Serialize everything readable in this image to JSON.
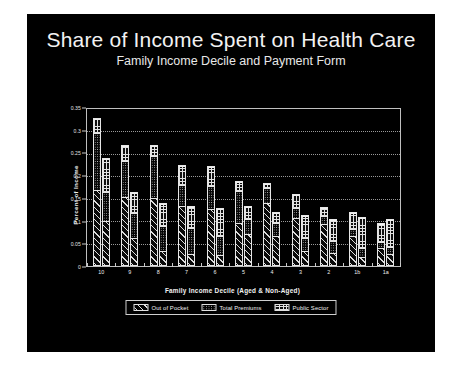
{
  "slide": {
    "title": "Share of Income Spent on Health Care",
    "subtitle": "Family Income Decile and Payment Form",
    "background_color": "#000000",
    "text_color": "#f2f2f2"
  },
  "legend": {
    "items": [
      {
        "label": "Out of Pocket",
        "pattern": "diagonal-hatch"
      },
      {
        "label": "Total Premiums",
        "pattern": "dotted"
      },
      {
        "label": "Public Sector",
        "pattern": "brick"
      }
    ]
  },
  "chart_data": {
    "type": "bar",
    "title": "Share of Income Spent on Health Care",
    "subtitle": "Family Income Decile and Payment Form",
    "xlabel": "Family Income Decile (Aged & Non-Aged)",
    "ylabel": "Percent of Income",
    "ylim": [
      0,
      0.35
    ],
    "yticks": [
      0,
      0.05,
      0.1,
      0.15,
      0.2,
      0.25,
      0.3,
      0.35
    ],
    "ytick_labels": [
      "0",
      "0.05",
      "0.1",
      "0.15",
      "0.2",
      "0.25",
      "0.3",
      "0.35"
    ],
    "grid": true,
    "stacked": true,
    "legend_position": "bottom",
    "categories": [
      "10",
      "9",
      "8",
      "7",
      "6",
      "5",
      "4",
      "3",
      "2",
      "1b",
      "1a"
    ],
    "bars_per_category": 2,
    "bar_subgroups": [
      "Aged",
      "Non-Aged"
    ],
    "series": [
      {
        "name": "Out of Pocket",
        "pattern": "diagonal-hatch",
        "values_aged": [
          0.17,
          0.155,
          0.152,
          0.135,
          0.128,
          0.095,
          0.141,
          0.108,
          0.095,
          0.068,
          0.04
        ],
        "values_nonaged": [
          0.1,
          0.063,
          0.032,
          0.025,
          0.022,
          0.072,
          0.068,
          0.032,
          0.028,
          0.018,
          0.025
        ]
      },
      {
        "name": "Total Premiums",
        "pattern": "dotted",
        "values_aged": [
          0.128,
          0.08,
          0.095,
          0.048,
          0.052,
          0.075,
          0.035,
          0.023,
          0.017,
          0.015,
          0.013
        ],
        "values_nonaged": [
          0.065,
          0.056,
          0.057,
          0.06,
          0.046,
          0.034,
          0.03,
          0.03,
          0.028,
          0.022,
          0.018
        ]
      },
      {
        "name": "Public Sector",
        "pattern": "brick",
        "values_aged": [
          0.032,
          0.035,
          0.023,
          0.042,
          0.043,
          0.02,
          0.009,
          0.029,
          0.02,
          0.038,
          0.043
        ],
        "values_nonaged": [
          0.075,
          0.046,
          0.051,
          0.048,
          0.062,
          0.028,
          0.022,
          0.051,
          0.049,
          0.07,
          0.062
        ]
      }
    ],
    "totals_aged": [
      0.33,
      0.27,
      0.27,
      0.225,
      0.223,
      0.19,
      0.185,
      0.16,
      0.132,
      0.121,
      0.096
    ],
    "totals_nonaged": [
      0.24,
      0.165,
      0.14,
      0.133,
      0.13,
      0.134,
      0.12,
      0.113,
      0.105,
      0.11,
      0.105
    ]
  }
}
